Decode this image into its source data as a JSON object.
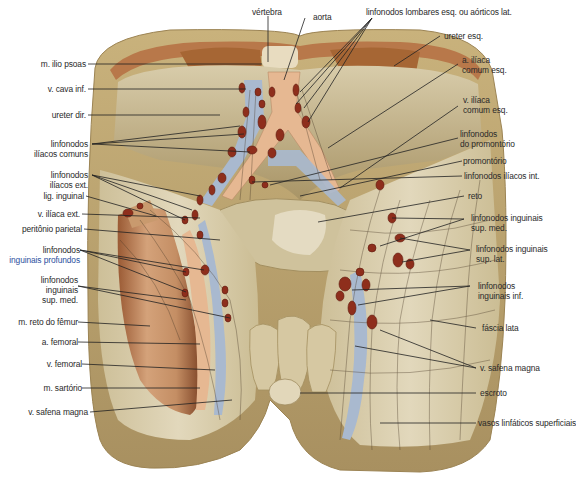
{
  "figure": {
    "colors": {
      "skin_outer": "#b8a270",
      "fascia": "#d9ccaa",
      "muscle": "#c99a6e",
      "muscle_dark": "#8a4a2a",
      "lymph_node": "#8e2e1c",
      "vein": "#a9b9cf",
      "artery": "#e6b892",
      "vessel_line": "#4a3a28",
      "leader_line": "#222222",
      "label_text": "#2a2a2a",
      "label_blue": "#2b4f9e"
    }
  },
  "labels_top": [
    {
      "id": "vertebra",
      "text": "vértebra"
    },
    {
      "id": "aorta",
      "text": "aorta"
    },
    {
      "id": "linfonodos-lombares",
      "text": "linfonodos lombares esq. ou aórticos lat."
    }
  ],
  "labels_left": [
    {
      "id": "m-ilio-psoas",
      "lines": [
        "m. ilio psoas"
      ]
    },
    {
      "id": "v-cava-inf",
      "lines": [
        "v. cava inf."
      ]
    },
    {
      "id": "ureter-dir",
      "lines": [
        "ureter dir."
      ]
    },
    {
      "id": "linfonodos-iliacos-comuns",
      "lines": [
        "linfonodos",
        "ilíacos comuns"
      ]
    },
    {
      "id": "linfonodos-iliacos-ext",
      "lines": [
        "linfonodos",
        "ilíacos ext."
      ]
    },
    {
      "id": "lig-inguinal",
      "lines": [
        "lig. inguinal"
      ]
    },
    {
      "id": "v-iliaca-ext",
      "lines": [
        "v. ilíaca ext."
      ]
    },
    {
      "id": "peritonio-parietal",
      "lines": [
        "peritônio parietal"
      ]
    },
    {
      "id": "linfonodos-inguinais-profundos",
      "lines": [
        "linfonodos",
        "inguinais profundos"
      ]
    },
    {
      "id": "linfonodos-inguinais-sup-med-left",
      "lines": [
        "linfonodos",
        "inguinais",
        "sup. med."
      ]
    },
    {
      "id": "m-reto-do-femur",
      "lines": [
        "m. reto do fêmur"
      ]
    },
    {
      "id": "a-femoral",
      "lines": [
        "a. femoral"
      ]
    },
    {
      "id": "v-femoral",
      "lines": [
        "v. femoral"
      ]
    },
    {
      "id": "m-sartorio",
      "lines": [
        "m. sartório"
      ]
    },
    {
      "id": "v-safena-magna-left",
      "lines": [
        "v. safena magna"
      ]
    }
  ],
  "labels_right": [
    {
      "id": "ureter-esq",
      "lines": [
        "ureter esq."
      ]
    },
    {
      "id": "a-iliaca-comum-esq",
      "lines": [
        "a. ilíaca",
        "comum esq."
      ]
    },
    {
      "id": "v-iliaca-comum-esq",
      "lines": [
        "v. ilíaca",
        "comum esq."
      ]
    },
    {
      "id": "linfonodos-do-promontorio",
      "lines": [
        "linfonodos",
        "do promontório"
      ]
    },
    {
      "id": "promontorio",
      "lines": [
        "promontório"
      ]
    },
    {
      "id": "linfonodos-iliacos-int",
      "lines": [
        "linfonodos ilíacos int."
      ]
    },
    {
      "id": "reto",
      "lines": [
        "reto"
      ]
    },
    {
      "id": "linfonodos-inguinais-sup-med-right",
      "lines": [
        "linfonodos inguinais",
        "sup. med."
      ]
    },
    {
      "id": "linfonodos-inguinais-sup-lat",
      "lines": [
        "linfonodos inguinais",
        "sup. lat."
      ]
    },
    {
      "id": "linfonodos-inguinais-inf",
      "lines": [
        "linfonodos",
        "inguinais inf."
      ]
    },
    {
      "id": "fascia-lata",
      "lines": [
        "fáscia lata"
      ]
    },
    {
      "id": "v-safena-magna-right",
      "lines": [
        "v. safena magna"
      ]
    },
    {
      "id": "escroto",
      "lines": [
        "escroto"
      ]
    },
    {
      "id": "vasos-linfaticos-superficiais",
      "lines": [
        "vasos linfáticos superficiais"
      ]
    }
  ]
}
